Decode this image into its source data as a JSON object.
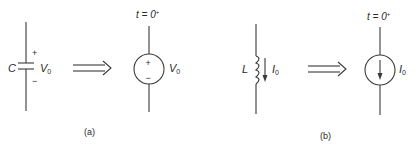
{
  "figure": {
    "panel_a": {
      "caption": "(a)",
      "capacitor": {
        "symbol_label": "C",
        "plus": "+",
        "minus": "−",
        "voltage_label_main": "V",
        "voltage_label_sub": "0"
      },
      "equivalent_source": {
        "type": "voltage-source",
        "time_label": "t = 0",
        "time_sup": "+",
        "plus": "+",
        "minus": "−",
        "voltage_label_main": "V",
        "voltage_label_sub": "0"
      }
    },
    "panel_b": {
      "caption": "(b)",
      "inductor": {
        "symbol_label": "L",
        "current_label_main": "I",
        "current_label_sub": "0"
      },
      "equivalent_source": {
        "type": "current-source",
        "time_label": "t = 0",
        "time_sup": "+",
        "current_label_main": "I",
        "current_label_sub": "0"
      }
    }
  },
  "colors": {
    "ink": "#3a3a3a",
    "background": "#ffffff"
  }
}
